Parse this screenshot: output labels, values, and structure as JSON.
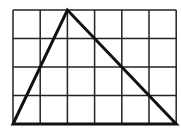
{
  "diagram": {
    "type": "grid-with-triangle",
    "grid": {
      "columns": 6,
      "rows": 4,
      "origin_px": [
        13,
        10
      ],
      "cell_width_px": 27.2,
      "cell_height_px": 28.5,
      "line_color": "#222222",
      "line_width": 1.5
    },
    "triangle": {
      "vertices_grid": [
        [
          0,
          0
        ],
        [
          2,
          4
        ],
        [
          6,
          0
        ]
      ],
      "stroke_color": "#111111",
      "stroke_width": 3
    }
  }
}
